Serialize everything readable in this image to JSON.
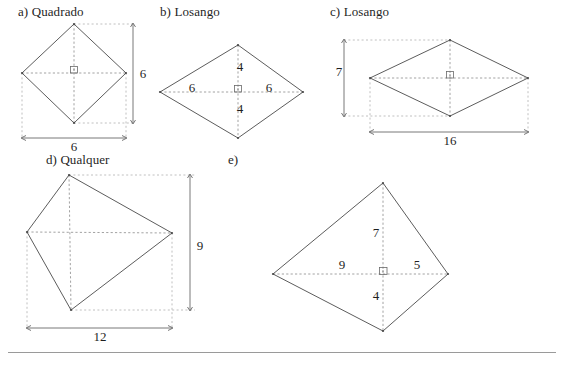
{
  "page": {
    "background_color": "#ffffff",
    "line_color": "#4a4a4a",
    "dash_color": "#8a8a8a"
  },
  "figures": [
    {
      "id": "a",
      "label": "a) Quadrado",
      "shape": "square",
      "labels": [
        {
          "text": "6",
          "role": "vertical-dimension"
        },
        {
          "text": "6",
          "role": "horizontal-dimension"
        }
      ],
      "right_angle_marker": true
    },
    {
      "id": "b",
      "label": "b) Losango",
      "shape": "rhombus",
      "labels": [
        {
          "text": "4",
          "role": "upper-half-diagonal"
        },
        {
          "text": "4",
          "role": "lower-half-diagonal"
        },
        {
          "text": "6",
          "role": "left-half-diagonal"
        },
        {
          "text": "6",
          "role": "right-half-diagonal"
        }
      ],
      "right_angle_marker": true
    },
    {
      "id": "c",
      "label": "c) Losango",
      "shape": "rhombus",
      "labels": [
        {
          "text": "7",
          "role": "vertical-dimension"
        },
        {
          "text": "16",
          "role": "horizontal-dimension"
        }
      ],
      "right_angle_marker": true
    },
    {
      "id": "d",
      "label": "d) Qualquer",
      "shape": "irregular-quadrilateral",
      "labels": [
        {
          "text": "9",
          "role": "vertical-dimension"
        },
        {
          "text": "12",
          "role": "horizontal-dimension"
        }
      ],
      "right_angle_marker": false
    },
    {
      "id": "e",
      "label": "e)",
      "shape": "kite",
      "labels": [
        {
          "text": "7",
          "role": "upper-half-diagonal"
        },
        {
          "text": "4",
          "role": "lower-half-diagonal"
        },
        {
          "text": "9",
          "role": "left-half-diagonal"
        },
        {
          "text": "5",
          "role": "right-half-diagonal"
        }
      ],
      "right_angle_marker": true
    }
  ]
}
